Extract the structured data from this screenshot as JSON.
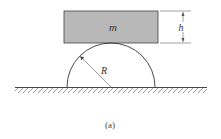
{
  "figure": {
    "caption": "(a)",
    "labels": {
      "mass": "m",
      "height": "h",
      "radius": "R"
    },
    "colors": {
      "block_fill": "#b8b8b8",
      "stroke": "#333333",
      "background": "#ffffff"
    },
    "elements": {
      "block": "rectangular block of mass m with height h resting on top of semicylinder",
      "semicylinder": "half-cylinder of radius R fixed on ground",
      "ground": "hatched horizontal surface"
    }
  }
}
